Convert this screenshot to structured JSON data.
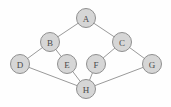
{
  "figure": {
    "width": 171,
    "height": 107,
    "background_color": "#fefefe"
  },
  "style": {
    "node_fill": "#d6d6d6",
    "node_stroke": "#8f8f8f",
    "node_radius": 9.5,
    "node_stroke_width": 1,
    "edge_stroke": "#9a9a9a",
    "edge_stroke_width": 1,
    "label_color": "#4a4a4a",
    "label_font_size": 9
  },
  "graph": {
    "type": "undirected",
    "node_count": 8,
    "edge_count": 10,
    "nodes": [
      {
        "id": "A",
        "label": "A",
        "x": 86,
        "y": 18
      },
      {
        "id": "B",
        "label": "B",
        "x": 50,
        "y": 42
      },
      {
        "id": "C",
        "label": "C",
        "x": 122,
        "y": 42
      },
      {
        "id": "D",
        "label": "D",
        "x": 20,
        "y": 64
      },
      {
        "id": "E",
        "label": "E",
        "x": 67,
        "y": 64
      },
      {
        "id": "F",
        "label": "F",
        "x": 96,
        "y": 64
      },
      {
        "id": "G",
        "label": "G",
        "x": 152,
        "y": 64
      },
      {
        "id": "H",
        "label": "H",
        "x": 86,
        "y": 89
      }
    ],
    "edges": [
      {
        "id": "A-B",
        "source": "A",
        "target": "B",
        "x1": 86,
        "y1": 18,
        "x2": 50,
        "y2": 42
      },
      {
        "id": "A-C",
        "source": "A",
        "target": "C",
        "x1": 86,
        "y1": 18,
        "x2": 122,
        "y2": 42
      },
      {
        "id": "B-D",
        "source": "B",
        "target": "D",
        "x1": 50,
        "y1": 42,
        "x2": 20,
        "y2": 64
      },
      {
        "id": "B-E",
        "source": "B",
        "target": "E",
        "x1": 50,
        "y1": 42,
        "x2": 67,
        "y2": 64
      },
      {
        "id": "C-F",
        "source": "C",
        "target": "F",
        "x1": 122,
        "y1": 42,
        "x2": 96,
        "y2": 64
      },
      {
        "id": "C-G",
        "source": "C",
        "target": "G",
        "x1": 122,
        "y1": 42,
        "x2": 152,
        "y2": 64
      },
      {
        "id": "D-H",
        "source": "D",
        "target": "H",
        "x1": 20,
        "y1": 64,
        "x2": 86,
        "y2": 89
      },
      {
        "id": "E-H",
        "source": "E",
        "target": "H",
        "x1": 67,
        "y1": 64,
        "x2": 86,
        "y2": 89
      },
      {
        "id": "F-H",
        "source": "F",
        "target": "H",
        "x1": 96,
        "y1": 64,
        "x2": 86,
        "y2": 89
      },
      {
        "id": "G-H",
        "source": "G",
        "target": "H",
        "x1": 152,
        "y1": 64,
        "x2": 86,
        "y2": 89
      }
    ]
  }
}
